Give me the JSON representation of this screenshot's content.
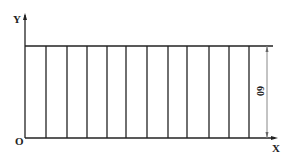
{
  "diagram": {
    "type": "strip-grid",
    "axes": {
      "x_label": "X",
      "y_label": "Y",
      "origin_label": "O"
    },
    "dimension": {
      "value": "60",
      "orientation": "vertical"
    },
    "strip_count": 12,
    "colors": {
      "line": "#222222",
      "dimension_line": "#888888",
      "background": "#ffffff"
    }
  }
}
